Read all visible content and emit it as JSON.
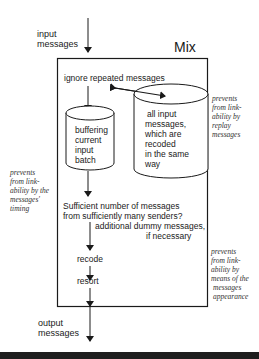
{
  "title": "Mix",
  "input_label": [
    "input",
    "messages"
  ],
  "output_label": [
    "output",
    "messages"
  ],
  "steps": {
    "ignore": "ignore repeated messages",
    "buffer_db": [
      "buffering",
      "current",
      "input",
      "batch"
    ],
    "store_db": [
      "all input",
      "messages,",
      "which are",
      "recoded",
      "in the same",
      "way"
    ],
    "sufficient": [
      "Sufficient number of messages",
      "from sufficiently many senders?"
    ],
    "dummy": [
      "additional dummy messages,",
      "if necessary"
    ],
    "recode": "recode",
    "resort": "resort"
  },
  "annotations": {
    "replay": [
      "prevents",
      "from link-",
      "ability by",
      "replay",
      "messages"
    ],
    "timing": [
      "prevents",
      "from link-",
      "ability by the",
      "messages'",
      "timing"
    ],
    "appearance": [
      "prevents",
      "from link-",
      "ability by",
      "means of the",
      "messages",
      "appearance"
    ]
  },
  "colors": {
    "stroke": "#1a1a1a",
    "band": "#1e1e1e"
  }
}
